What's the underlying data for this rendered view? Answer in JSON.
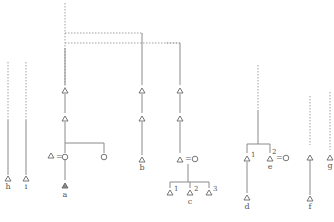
{
  "diagram": {
    "type": "kinship-genealogy-chart",
    "colors": {
      "line": "#8a8a8a",
      "dotted": "#a8a8a8",
      "symbol": "#666666",
      "text": "#555555"
    },
    "symbols": {
      "male": "triangle",
      "female": "circle",
      "marriage": "="
    },
    "labels": {
      "h": "h",
      "i": "i",
      "a": "a",
      "b": "b",
      "c": "c",
      "d": "d",
      "e": "e",
      "f": "f",
      "g": "g"
    },
    "superscripts": {
      "c1": "1",
      "c2": "2",
      "c3": "3",
      "d1": "1",
      "e2": "2"
    },
    "marriage_sign": "="
  }
}
